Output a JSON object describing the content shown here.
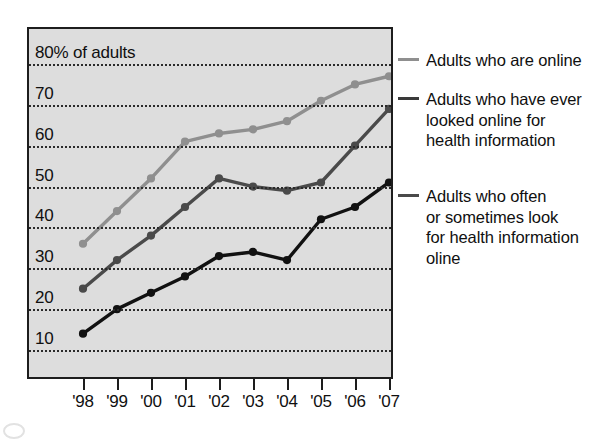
{
  "chart_data": {
    "type": "line",
    "title": "",
    "subtitle": "",
    "xlabel": "",
    "ylabel": "80% of adults",
    "x": [
      "'98",
      "'99",
      "'00",
      "'01",
      "'02",
      "'03",
      "'04",
      "'05",
      "'06",
      "'07"
    ],
    "categories": [
      "'98",
      "'99",
      "'00",
      "'01",
      "'02",
      "'03",
      "'04",
      "'05",
      "'06",
      "'07"
    ],
    "ylim": [
      0,
      85
    ],
    "xlim": [
      0,
      9
    ],
    "y_ticks": [
      10,
      20,
      30,
      40,
      50,
      60,
      70,
      80
    ],
    "y_tick_labels": [
      "10",
      "20",
      "30",
      "40",
      "50",
      "60",
      "70",
      "80% of adults"
    ],
    "grid": true,
    "grid_style": "dotted-horizontal",
    "legend_position": "right",
    "plot_background": "#dddddd",
    "series": [
      {
        "name": "Adults who are online",
        "legend_label": "Adults who are online",
        "color": "#8f8f8f",
        "marker": "circle",
        "values": [
          36,
          44,
          52,
          61,
          63,
          64,
          66,
          71,
          75,
          77
        ]
      },
      {
        "name": "Adults who have ever looked online for health information",
        "legend_label": "Adults who have ever\nlooked online for\nhealth information",
        "color": "#4a4a4a",
        "marker": "circle",
        "values": [
          25,
          32,
          38,
          45,
          52,
          50,
          49,
          51,
          60,
          69
        ]
      },
      {
        "name": "Adults who often or sometimes look for health information online",
        "legend_label": "Adults who often\nor sometimes look\nfor health information\noline",
        "color": "#111111",
        "marker": "circle",
        "values": [
          14,
          20,
          24,
          28,
          33,
          34,
          32,
          42,
          45,
          51
        ]
      }
    ]
  },
  "axis": {
    "y_labels": [
      {
        "text": "80% of adults",
        "value": 80
      },
      {
        "text": "70",
        "value": 70
      },
      {
        "text": "60",
        "value": 60
      },
      {
        "text": "50",
        "value": 50
      },
      {
        "text": "40",
        "value": 40
      },
      {
        "text": "30",
        "value": 30
      },
      {
        "text": "20",
        "value": 20
      },
      {
        "text": "10",
        "value": 10
      }
    ],
    "x_labels": [
      "'98",
      "'99",
      "'00",
      "'01",
      "'02",
      "'03",
      "'04",
      "'05",
      "'06",
      "'07"
    ]
  },
  "legend": {
    "entries": [
      {
        "label": "Adults who are online",
        "color": "#8f8f8f"
      },
      {
        "label": "Adults who have ever\nlooked online for\nhealth information",
        "color": "#3a3a3a"
      },
      {
        "label": "Adults who often\nor sometimes look\nfor health information\noline",
        "color": "#4a4a4a"
      }
    ]
  }
}
